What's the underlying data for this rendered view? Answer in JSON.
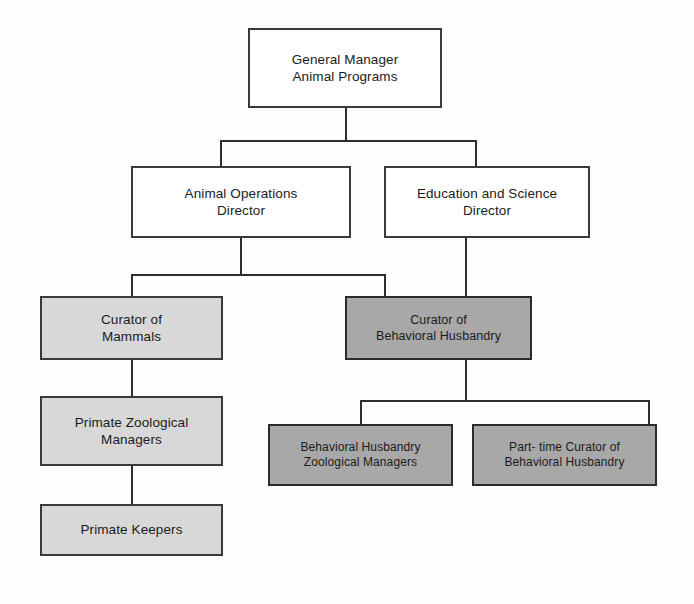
{
  "chart": {
    "type": "org-chart",
    "colors": {
      "background": "#fdfdfc",
      "box_plain_fill": "#ffffff",
      "box_light_fill": "#d8d8d8",
      "box_dark_fill": "#a8a8a8",
      "border": "#3a3a3a",
      "connector": "#2e2e2e"
    },
    "nodes": [
      {
        "id": "general-manager",
        "label": "General Manager\nAnimal Programs",
        "style": "plain",
        "level": 1
      },
      {
        "id": "animal-operations-director",
        "label": "Animal Operations\nDirector",
        "style": "plain",
        "level": 2
      },
      {
        "id": "education-science-director",
        "label": "Education and Science\nDirector",
        "style": "plain",
        "level": 2
      },
      {
        "id": "curator-of-mammals",
        "label": "Curator of\nMammals",
        "style": "light",
        "level": 3
      },
      {
        "id": "curator-behavioral-husbandry",
        "label": "Curator of\nBehavioral Husbandry",
        "style": "dark",
        "level": 3
      },
      {
        "id": "primate-zoological-managers",
        "label": "Primate Zoological\nManagers",
        "style": "light",
        "level": 4
      },
      {
        "id": "behavioral-husbandry-zoological-managers",
        "label": "Behavioral Husbandry\nZoological Managers",
        "style": "dark",
        "level": 4
      },
      {
        "id": "part-time-curator-behavioral-husbandry",
        "label": "Part- time Curator of\nBehavioral Husbandry",
        "style": "dark",
        "level": 4
      },
      {
        "id": "primate-keepers",
        "label": "Primate Keepers",
        "style": "light",
        "level": 5
      }
    ],
    "edges": [
      {
        "from": "general-manager",
        "to": "animal-operations-director"
      },
      {
        "from": "general-manager",
        "to": "education-science-director"
      },
      {
        "from": "animal-operations-director",
        "to": "curator-of-mammals"
      },
      {
        "from": "animal-operations-director",
        "to": "curator-behavioral-husbandry"
      },
      {
        "from": "education-science-director",
        "to": "curator-behavioral-husbandry"
      },
      {
        "from": "curator-of-mammals",
        "to": "primate-zoological-managers"
      },
      {
        "from": "primate-zoological-managers",
        "to": "primate-keepers"
      },
      {
        "from": "curator-behavioral-husbandry",
        "to": "behavioral-husbandry-zoological-managers"
      },
      {
        "from": "curator-behavioral-husbandry",
        "to": "part-time-curator-behavioral-husbandry"
      }
    ]
  }
}
